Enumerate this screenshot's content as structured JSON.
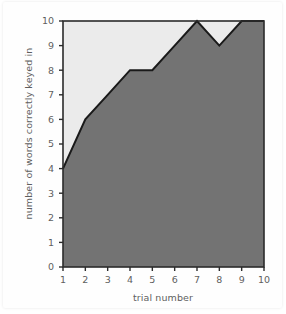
{
  "chart_data": {
    "type": "area",
    "title": "",
    "xlabel": "trial number",
    "ylabel": "number of words correctly keyed in",
    "categories": [
      1,
      2,
      3,
      4,
      5,
      6,
      7,
      8,
      9,
      10
    ],
    "x": [
      1,
      2,
      3,
      4,
      5,
      6,
      7,
      8,
      9,
      10
    ],
    "values": [
      4,
      6,
      7,
      8,
      8,
      9,
      10,
      9,
      10,
      10
    ],
    "series": [
      {
        "name": "number of words correctly keyed in",
        "values": [
          4,
          6,
          7,
          8,
          8,
          9,
          10,
          9,
          10,
          10
        ]
      }
    ],
    "xlim": [
      1,
      10
    ],
    "ylim": [
      0,
      10
    ],
    "xticks": [
      "1",
      "2",
      "3",
      "4",
      "5",
      "6",
      "7",
      "8",
      "9",
      "10"
    ],
    "yticks": [
      "0",
      "1",
      "2",
      "3",
      "4",
      "5",
      "6",
      "7",
      "8",
      "9",
      "10"
    ],
    "grid": false,
    "legend": "none",
    "colors": {
      "area_fill": "#737373",
      "plot_background": "#ebebeb",
      "line": "#1a1a1a",
      "axis": "#2b2b2b",
      "tick_label": "#5e5e5e",
      "figure_background": "#ffffff"
    }
  }
}
